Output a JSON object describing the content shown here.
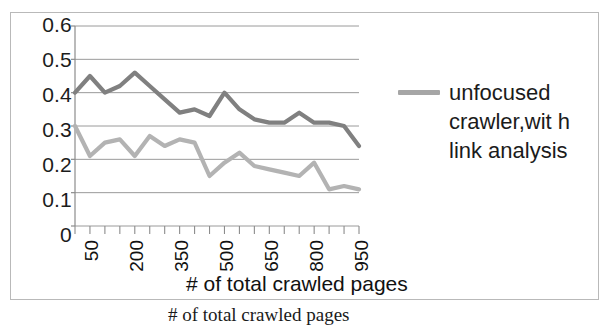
{
  "figure": {
    "caption": "# of total crawled pages"
  },
  "legend": {
    "position": "right",
    "entries": [
      {
        "label": "unfocused crawler,with link analysis",
        "display_label": "unfocused crawler,wit h link analysis",
        "color": "#a6a6a6"
      }
    ]
  },
  "chart_data": {
    "type": "line",
    "title": "",
    "subtitle": "",
    "xlabel": "# of total crawled pages",
    "ylabel": "",
    "grid": true,
    "legend_position": "right",
    "xlim": [
      50,
      1000
    ],
    "ylim": [
      0,
      0.6
    ],
    "ytick_labels": [
      "0.6",
      "0.5",
      "0.4",
      "0.3",
      "0.2",
      "0.1",
      "0"
    ],
    "yticks": [
      0.6,
      0.5,
      0.4,
      0.3,
      0.2,
      0.1,
      0
    ],
    "xtick_labels": [
      "50",
      "200",
      "350",
      "500",
      "650",
      "800",
      "950"
    ],
    "xticks": [
      50,
      200,
      350,
      500,
      650,
      800,
      950
    ],
    "x": [
      50,
      100,
      150,
      200,
      250,
      300,
      350,
      400,
      450,
      500,
      550,
      600,
      650,
      700,
      750,
      800,
      850,
      900,
      950,
      1000
    ],
    "series": [
      {
        "name": "unfocused crawler,with link analysis",
        "color": "#808080",
        "values": [
          0.4,
          0.45,
          0.4,
          0.42,
          0.46,
          0.42,
          0.38,
          0.34,
          0.35,
          0.33,
          0.4,
          0.35,
          0.32,
          0.31,
          0.31,
          0.34,
          0.31,
          0.31,
          0.3,
          0.24
        ]
      },
      {
        "name": "focused crawler",
        "color": "#b3b3b3",
        "values": [
          0.3,
          0.21,
          0.25,
          0.26,
          0.21,
          0.27,
          0.24,
          0.26,
          0.25,
          0.15,
          0.19,
          0.22,
          0.18,
          0.17,
          0.16,
          0.15,
          0.19,
          0.11,
          0.12,
          0.11
        ]
      }
    ]
  }
}
